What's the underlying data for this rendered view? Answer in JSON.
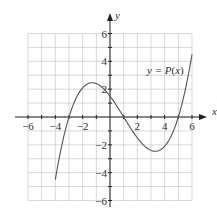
{
  "chart_data": {
    "type": "line",
    "title": "",
    "xlabel": "x",
    "ylabel": "y",
    "xlim": [
      -6,
      6
    ],
    "ylim": [
      -6,
      6
    ],
    "grid": true,
    "grid_step": 1,
    "x_ticks": [
      -6,
      -4,
      -2,
      2,
      4,
      6
    ],
    "y_ticks": [
      6,
      4,
      2,
      -2,
      -4,
      -6
    ],
    "x_tick_labels": [
      "−6",
      "−4",
      "−2",
      "2",
      "4",
      "6"
    ],
    "y_tick_labels": [
      "6",
      "4",
      "2",
      "−2",
      "−4",
      "−6"
    ],
    "series": [
      {
        "name": "y = P(x)",
        "formula": "0.1*(x+3)*(x-1)*(x-5)",
        "x_range": [
          -4,
          6
        ],
        "x": [
          -4,
          -3.5,
          -3,
          -2.5,
          -2,
          -1.5,
          -1,
          -0.5,
          0,
          0.5,
          1,
          1.5,
          2,
          2.5,
          3,
          3.5,
          4,
          4.5,
          5,
          5.5,
          6
        ],
        "values": [
          -4.5,
          -1.92,
          0,
          1.31,
          2.1,
          2.48,
          2.4,
          2.08,
          1.5,
          0.79,
          0,
          -0.79,
          -1.5,
          -2.08,
          -2.4,
          -2.48,
          -2.1,
          -1.31,
          0,
          1.92,
          4.5
        ],
        "roots": [
          -3,
          1,
          5
        ],
        "local_max": [
          -1.3,
          2.5
        ],
        "local_min": [
          3.3,
          -2.5
        ]
      }
    ],
    "annotations": [
      {
        "text_prefix": "y = ",
        "text_fn": "P",
        "text_arg": "(x)",
        "x": 3.6,
        "y": 3.3
      }
    ],
    "legend": "none"
  },
  "labels": {
    "x_axis": "x",
    "y_axis": "y",
    "fn_prefix": "y = ",
    "fn_name": "P",
    "fn_arg_open": "(",
    "fn_arg_var": "x",
    "fn_arg_close": ")"
  }
}
